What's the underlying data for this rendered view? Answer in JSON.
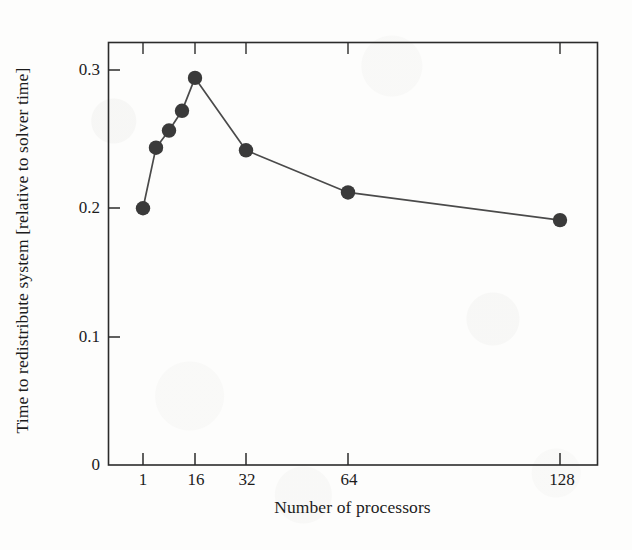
{
  "chart_data": {
    "type": "line",
    "title": "",
    "xlabel": "Number of processors",
    "ylabel": "Time to redistribute system [relative to solver time]",
    "x": [
      1,
      2,
      4,
      8,
      16,
      32,
      64,
      128
    ],
    "values": [
      0.195,
      0.241,
      0.254,
      0.269,
      0.294,
      0.239,
      0.207,
      0.186
    ],
    "series": [
      {
        "name": "redistribution time",
        "x": [
          1,
          2,
          4,
          8,
          16,
          32,
          64,
          128
        ],
        "values": [
          0.195,
          0.241,
          0.254,
          0.269,
          0.294,
          0.239,
          0.207,
          0.186
        ]
      }
    ],
    "xticks": [
      1,
      16,
      32,
      64,
      128
    ],
    "xtick_labels": [
      "1",
      "16",
      "32",
      "64",
      "128"
    ],
    "yticks": [
      0,
      0.1,
      0.2,
      0.3
    ],
    "ytick_labels": [
      "0",
      "0.1",
      "0.2",
      "0.3"
    ],
    "ylim": [
      0,
      0.33
    ],
    "grid": false,
    "legend": false,
    "marker": "filled-circle",
    "marker_color": "#3a3a3a",
    "line_color": "#4a4a4a",
    "axis_color": "#2b2b2b"
  },
  "axes": {
    "ylabel": "Time to redistribute system [relative to solver time]",
    "xlabel": "Number of processors",
    "ytick_labels": [
      "0.3",
      "0.2",
      "0.1",
      "0"
    ],
    "xtick_labels": [
      "1",
      "16",
      "32",
      "64",
      "128"
    ]
  }
}
